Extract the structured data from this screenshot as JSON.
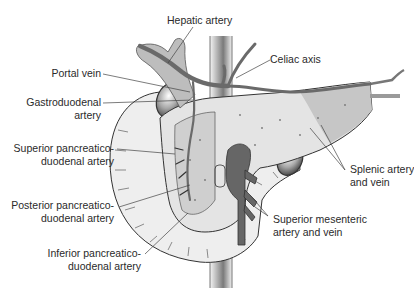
{
  "diagram": {
    "colors": {
      "background": "#ffffff",
      "pancreas_fill": "#e6e6e6",
      "pancreas_dark": "#bdbdbd",
      "vessel_dark": "#6a6a6a",
      "vessel_mid": "#9a9a9a",
      "outline": "#333333",
      "leader": "#444444",
      "text": "#2a2a2a"
    },
    "labels": {
      "hepatic_artery": {
        "lines": [
          "Hepatic artery"
        ]
      },
      "portal_vein": {
        "lines": [
          "Portal vein"
        ]
      },
      "celiac_axis": {
        "lines": [
          "Celiac axis"
        ]
      },
      "gastroduodenal_artery": {
        "lines": [
          "Gastroduodenal",
          "artery"
        ]
      },
      "superior_pd_artery": {
        "lines": [
          "Superior pancreatico-",
          "duodenal artery"
        ]
      },
      "splenic_artery_vein": {
        "lines": [
          "Splenic artery",
          "and vein"
        ]
      },
      "posterior_pd_artery": {
        "lines": [
          "Posterior pancreatico-",
          "duodenal artery"
        ]
      },
      "superior_mesenteric": {
        "lines": [
          "Superior mesenteric",
          "artery and vein"
        ]
      },
      "inferior_pd_artery": {
        "lines": [
          "Inferior pancreatico-",
          "duodenal artery"
        ]
      }
    }
  }
}
